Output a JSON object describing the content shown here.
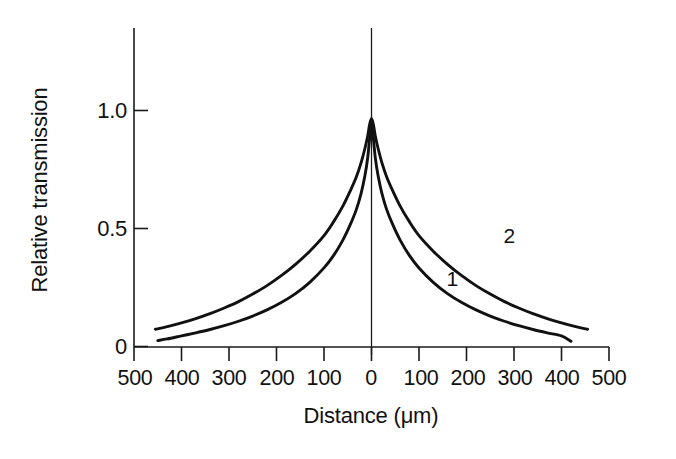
{
  "chart_data": {
    "type": "line",
    "title": "",
    "subtitle": "",
    "xlabel": "Distance (μm)",
    "ylabel": "Relative transmission",
    "xlim": [
      -500,
      500
    ],
    "ylim": [
      0,
      1.28
    ],
    "grid": false,
    "legend_position": "inline-curve-labels",
    "x_ticks": [
      -500,
      -400,
      -300,
      -200,
      -100,
      0,
      100,
      200,
      300,
      400,
      500
    ],
    "x_tick_labels": [
      "500",
      "400",
      "300",
      "200",
      "100",
      "0",
      "100",
      "200",
      "300",
      "400",
      "500"
    ],
    "y_ticks": [
      0,
      0.5,
      1.0
    ],
    "y_tick_labels": [
      "0",
      "0.5",
      "1.0"
    ],
    "annotations": [
      {
        "text": "1",
        "x": 170,
        "y": 0.255,
        "name": "curve-label-1"
      },
      {
        "text": "2",
        "x": 290,
        "y": 0.44,
        "name": "curve-label-2"
      }
    ],
    "vertical_reference_line": {
      "x": 0,
      "label": ""
    },
    "series": [
      {
        "name": "1",
        "label": "1",
        "x": [
          -450,
          -430,
          -400,
          -370,
          -340,
          -310,
          -280,
          -250,
          -220,
          -190,
          -160,
          -130,
          -100,
          -80,
          -60,
          -45,
          -32,
          -22,
          -14,
          -8,
          -4,
          0,
          4,
          8,
          14,
          22,
          32,
          45,
          60,
          80,
          100,
          130,
          160,
          190,
          220,
          250,
          280,
          310,
          340,
          370,
          400,
          420
        ],
        "y": [
          0.025,
          0.032,
          0.045,
          0.058,
          0.072,
          0.088,
          0.107,
          0.129,
          0.155,
          0.186,
          0.224,
          0.272,
          0.333,
          0.385,
          0.452,
          0.515,
          0.58,
          0.648,
          0.722,
          0.8,
          0.88,
          0.935,
          0.88,
          0.8,
          0.722,
          0.648,
          0.58,
          0.515,
          0.452,
          0.385,
          0.333,
          0.272,
          0.224,
          0.186,
          0.155,
          0.129,
          0.107,
          0.088,
          0.072,
          0.058,
          0.045,
          0.022
        ]
      },
      {
        "name": "2",
        "label": "2",
        "x": [
          -455,
          -430,
          -400,
          -370,
          -340,
          -310,
          -280,
          -250,
          -220,
          -190,
          -160,
          -130,
          -100,
          -80,
          -60,
          -45,
          -32,
          -22,
          -14,
          -8,
          -4,
          0,
          4,
          8,
          14,
          22,
          32,
          45,
          60,
          80,
          100,
          130,
          160,
          190,
          220,
          250,
          280,
          310,
          340,
          370,
          400,
          430,
          455
        ],
        "y": [
          0.073,
          0.084,
          0.1,
          0.118,
          0.139,
          0.163,
          0.19,
          0.222,
          0.258,
          0.3,
          0.348,
          0.404,
          0.47,
          0.528,
          0.596,
          0.658,
          0.718,
          0.778,
          0.838,
          0.892,
          0.94,
          0.966,
          0.94,
          0.892,
          0.838,
          0.778,
          0.718,
          0.658,
          0.596,
          0.528,
          0.47,
          0.404,
          0.348,
          0.3,
          0.258,
          0.222,
          0.19,
          0.163,
          0.139,
          0.118,
          0.1,
          0.084,
          0.073
        ]
      }
    ]
  },
  "figure": {
    "background_color": "#ffffff",
    "line_color": "#111111"
  }
}
